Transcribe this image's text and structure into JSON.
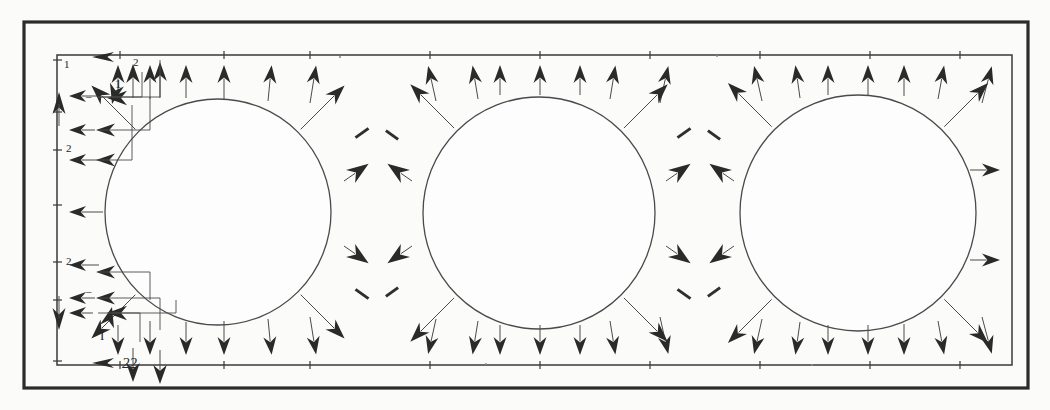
{
  "figure": {
    "domain_type": "diagram",
    "background_color": "#fbfbfa",
    "ink_color": "#2a2a2a",
    "line_color": "#4a4a4a",
    "canvas": {
      "width": 1050,
      "height": 410
    },
    "outer_frame": {
      "x": 24,
      "y": 22,
      "width": 1004,
      "height": 366,
      "stroke_width": 3.2
    },
    "inner_frame": {
      "x": 57,
      "y": 55,
      "width": 955,
      "height": 310,
      "stroke_width": 1.5
    },
    "circles": [
      {
        "name": "circle-left",
        "cx": 218,
        "cy": 212,
        "r": 113
      },
      {
        "name": "circle-middle",
        "cx": 539,
        "cy": 213,
        "r": 116
      },
      {
        "name": "circle-right",
        "cx": 858,
        "cy": 213,
        "r": 118
      }
    ],
    "labels": [
      {
        "id": "label-top-1",
        "text": "1",
        "x": 64,
        "y": 68,
        "style": "small"
      },
      {
        "id": "label-top-2",
        "text": "2",
        "x": 133,
        "y": 66,
        "style": "small"
      },
      {
        "id": "label-inner-1",
        "text": "1",
        "x": 115,
        "y": 88,
        "style": "normal"
      },
      {
        "id": "label-left-dash",
        "text": "–",
        "x": 86,
        "y": 100,
        "style": "small"
      },
      {
        "id": "label-left-mid-2",
        "text": "2",
        "x": 66,
        "y": 152,
        "style": "small"
      },
      {
        "id": "label-left-low-2",
        "text": "2",
        "x": 66,
        "y": 265,
        "style": "small"
      },
      {
        "id": "label-low-dash",
        "text": "–",
        "x": 86,
        "y": 295,
        "style": "small"
      },
      {
        "id": "label-bottom-I",
        "text": "I",
        "x": 100,
        "y": 340,
        "style": "normal"
      },
      {
        "id": "label-bottom-22",
        "text": "22",
        "x": 122,
        "y": 368,
        "style": "caption"
      }
    ],
    "left_ticks_y": [
      60,
      112,
      150,
      205,
      262,
      300,
      360
    ],
    "top_ticks_x": [
      57,
      120,
      200,
      310,
      430,
      540,
      650,
      760,
      870,
      960,
      1012
    ],
    "bottom_ticks_x": [
      57,
      120,
      200,
      310,
      430,
      540,
      650,
      760,
      870,
      960,
      1012
    ],
    "arrow_groups": {
      "top_edge_outward": "vectors pointing up out of the top boundary",
      "bottom_edge_outward": "vectors pointing down out of the bottom boundary",
      "left_edge_outward": "vectors pointing left out of the left boundary",
      "right_edge_outward": "vectors pointing right out of the right boundary",
      "saddle_clusters": "converging arrow pairs at the four saddle points between adjacent circles"
    }
  }
}
